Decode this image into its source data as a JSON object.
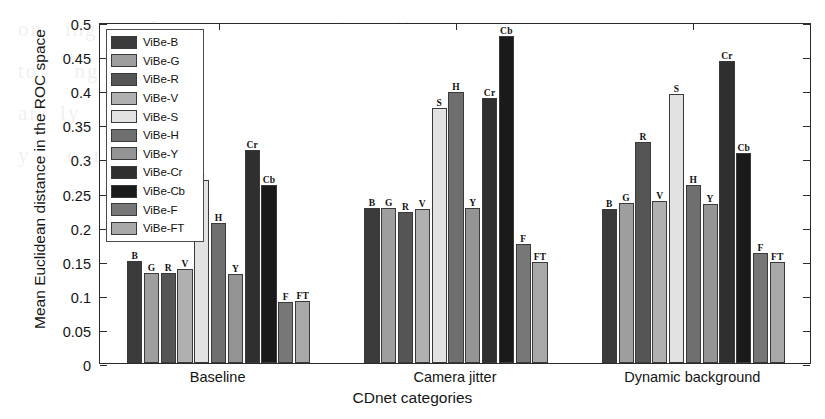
{
  "chart_data": {
    "type": "bar",
    "title": "",
    "xlabel": "CDnet categories",
    "ylabel": "Mean Euclidean distance in the ROC space",
    "ylim": [
      0,
      0.5
    ],
    "yticks": [
      "0",
      "0.05",
      "0.1",
      "0.15",
      "0.2",
      "0.25",
      "0.3",
      "0.35",
      "0.4",
      "0.45",
      "0.5"
    ],
    "ytick_values": [
      0,
      0.05,
      0.1,
      0.15,
      0.2,
      0.25,
      0.3,
      0.35,
      0.4,
      0.45,
      0.5
    ],
    "grid": false,
    "legend_position": "upper-left-inside",
    "categories": [
      "Baseline",
      "Camera jitter",
      "Dynamic background"
    ],
    "bar_labels": [
      "B",
      "G",
      "R",
      "V",
      "S",
      "H",
      "Y",
      "Cr",
      "Cb",
      "F",
      "FT"
    ],
    "series": [
      {
        "name": "ViBe-B",
        "short": "B",
        "color": "#3b3b3b",
        "values": [
          0.149,
          0.228,
          0.226
        ]
      },
      {
        "name": "ViBe-G",
        "short": "G",
        "color": "#9e9e9e",
        "values": [
          0.132,
          0.227,
          0.234
        ]
      },
      {
        "name": "ViBe-R",
        "short": "R",
        "color": "#555555",
        "values": [
          0.132,
          0.221,
          0.324
        ]
      },
      {
        "name": "ViBe-V",
        "short": "V",
        "color": "#b0b0b0",
        "values": [
          0.138,
          0.226,
          0.237
        ]
      },
      {
        "name": "ViBe-S",
        "short": "S",
        "color": "#e2e2e2",
        "values": [
          0.268,
          0.374,
          0.395
        ]
      },
      {
        "name": "ViBe-H",
        "short": "H",
        "color": "#6f6f6f",
        "values": [
          0.205,
          0.398,
          0.261
        ]
      },
      {
        "name": "ViBe-Y",
        "short": "Y",
        "color": "#949494",
        "values": [
          0.131,
          0.227,
          0.233
        ]
      },
      {
        "name": "ViBe-Cr",
        "short": "Cr",
        "color": "#2f2f2f",
        "values": [
          0.313,
          0.388,
          0.443
        ]
      },
      {
        "name": "ViBe-Cb",
        "short": "Cb",
        "color": "#1a1a1a",
        "values": [
          0.261,
          0.479,
          0.308
        ]
      },
      {
        "name": "ViBe-F",
        "short": "F",
        "color": "#777777",
        "values": [
          0.089,
          0.175,
          0.161
        ]
      },
      {
        "name": "ViBe-FT",
        "short": "FT",
        "color": "#a8a8a8",
        "values": [
          0.091,
          0.148,
          0.148
        ]
      }
    ]
  },
  "legend": {
    "items": [
      {
        "label": "ViBe-B"
      },
      {
        "label": "ViBe-G"
      },
      {
        "label": "ViBe-R"
      },
      {
        "label": "ViBe-V"
      },
      {
        "label": "ViBe-S"
      },
      {
        "label": "ViBe-H"
      },
      {
        "label": "ViBe-Y"
      },
      {
        "label": "ViBe-Cr"
      },
      {
        "label": "ViBe-Cb"
      },
      {
        "label": "ViBe-F"
      },
      {
        "label": "ViBe-FT"
      }
    ]
  },
  "page": {
    "bleed_text": "on   ing       for  to    eq         the   all     ng    ing      on     per      ng    n  f    to     ng    e  H    o   Bay  n   n\nar   ly        ch  a  ce     ts  no   ion   s  a     ng    o   tion    in   c  r   n   v  e   y     o  m   e    r  li  e"
  }
}
